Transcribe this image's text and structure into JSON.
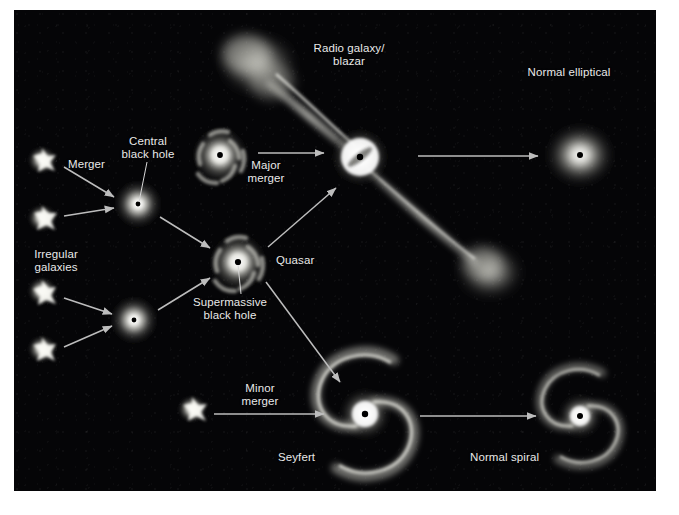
{
  "figure": {
    "background_color": "#ffffff",
    "plate_color": "#050507",
    "label_color": "#e9e9e9",
    "arrow_color": "#b9b9b9"
  },
  "labels": {
    "irregular_galaxies": "Irregular\ngalaxies",
    "merger": "Merger",
    "central_black_hole": "Central\nblack hole",
    "major_merger": "Major\nmerger",
    "quasar": "Quasar",
    "supermassive_black_hole": "Supermassive\nblack hole",
    "radio_galaxy_blazar": "Radio galaxy/\nblazar",
    "normal_elliptical": "Normal elliptical",
    "minor_merger": "Minor\nmerger",
    "seyfert": "Seyfert",
    "normal_spiral": "Normal spiral"
  },
  "diagram_nodes": [
    {
      "id": "irregular-1",
      "kind": "irregular-galaxy",
      "x": 42,
      "y": 160
    },
    {
      "id": "irregular-2",
      "kind": "irregular-galaxy",
      "x": 42,
      "y": 218
    },
    {
      "id": "irregular-3",
      "kind": "irregular-galaxy",
      "x": 42,
      "y": 291
    },
    {
      "id": "irregular-4",
      "kind": "irregular-galaxy",
      "x": 42,
      "y": 349
    },
    {
      "id": "merger-remnant-top",
      "kind": "compact-bulge",
      "x": 138,
      "y": 204
    },
    {
      "id": "merger-remnant-bot",
      "kind": "compact-bulge",
      "x": 134,
      "y": 320
    },
    {
      "id": "upper-disk-galaxy",
      "kind": "spiral-bulge",
      "x": 220,
      "y": 155
    },
    {
      "id": "quasar",
      "kind": "spiral-bulge",
      "x": 238,
      "y": 262
    },
    {
      "id": "radio-galaxy",
      "kind": "radio-galaxy-jets",
      "x": 360,
      "y": 157
    },
    {
      "id": "normal-elliptical",
      "kind": "elliptical",
      "x": 580,
      "y": 155
    },
    {
      "id": "minor-merger-blob",
      "kind": "irregular-galaxy",
      "x": 192,
      "y": 409
    },
    {
      "id": "seyfert",
      "kind": "grand-design-spiral",
      "x": 365,
      "y": 414
    },
    {
      "id": "normal-spiral",
      "kind": "grand-design-spiral",
      "x": 580,
      "y": 416
    }
  ],
  "diagram_arrows": [
    {
      "id": "irr1-to-merger-top",
      "from": "irregular-1",
      "to": "merger-remnant-top"
    },
    {
      "id": "irr2-to-merger-top",
      "from": "irregular-2",
      "to": "merger-remnant-top"
    },
    {
      "id": "irr3-to-merger-bot",
      "from": "irregular-3",
      "to": "merger-remnant-bot"
    },
    {
      "id": "irr4-to-merger-bot",
      "from": "irregular-4",
      "to": "merger-remnant-bot"
    },
    {
      "id": "merger-top-to-quasar",
      "from": "merger-remnant-top",
      "to": "quasar"
    },
    {
      "id": "merger-bot-to-quasar",
      "from": "merger-remnant-bot",
      "to": "quasar"
    },
    {
      "id": "major-merger-arrow",
      "from": "upper-disk-galaxy",
      "to": "radio-galaxy",
      "label": "Major\nmerger"
    },
    {
      "id": "quasar-to-radio",
      "from": "quasar",
      "to": "radio-galaxy"
    },
    {
      "id": "radio-to-elliptical",
      "from": "radio-galaxy",
      "to": "normal-elliptical"
    },
    {
      "id": "quasar-to-seyfert",
      "from": "quasar",
      "to": "seyfert"
    },
    {
      "id": "minor-merger-arrow",
      "from": "minor-merger-blob",
      "to": "seyfert",
      "label": "Minor\nmerger"
    },
    {
      "id": "seyfert-to-spiral",
      "from": "seyfert",
      "to": "normal-spiral"
    }
  ]
}
